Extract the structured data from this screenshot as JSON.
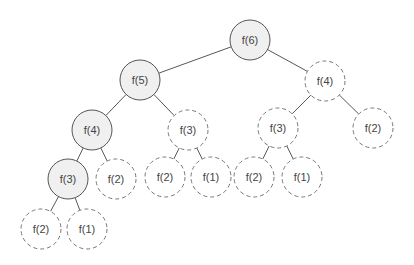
{
  "diagram": {
    "type": "recursion-tree",
    "radius": 20,
    "nodes": [
      {
        "id": "n0",
        "label": "f(6)",
        "x": 250,
        "y": 40,
        "style": "solid"
      },
      {
        "id": "n1",
        "label": "f(5)",
        "x": 140,
        "y": 80,
        "style": "solid"
      },
      {
        "id": "n2",
        "label": "f(4)",
        "x": 325,
        "y": 81,
        "style": "dashed"
      },
      {
        "id": "n3",
        "label": "f(4)",
        "x": 92,
        "y": 130,
        "style": "solid"
      },
      {
        "id": "n4",
        "label": "f(3)",
        "x": 188,
        "y": 130,
        "style": "dashed"
      },
      {
        "id": "n5",
        "label": "f(3)",
        "x": 278,
        "y": 128,
        "style": "dashed"
      },
      {
        "id": "n6",
        "label": "f(2)",
        "x": 373,
        "y": 128,
        "style": "dashed"
      },
      {
        "id": "n7",
        "label": "f(3)",
        "x": 68,
        "y": 179,
        "style": "solid"
      },
      {
        "id": "n8",
        "label": "f(2)",
        "x": 116,
        "y": 179,
        "style": "dashed"
      },
      {
        "id": "n9",
        "label": "f(2)",
        "x": 165,
        "y": 177,
        "style": "dashed"
      },
      {
        "id": "n10",
        "label": "f(1)",
        "x": 211,
        "y": 177,
        "style": "dashed"
      },
      {
        "id": "n11",
        "label": "f(2)",
        "x": 254,
        "y": 177,
        "style": "dashed"
      },
      {
        "id": "n12",
        "label": "f(1)",
        "x": 302,
        "y": 177,
        "style": "dashed"
      },
      {
        "id": "n13",
        "label": "f(2)",
        "x": 41,
        "y": 229,
        "style": "dashed"
      },
      {
        "id": "n14",
        "label": "f(1)",
        "x": 87,
        "y": 229,
        "style": "dashed"
      }
    ],
    "edges": [
      [
        "n0",
        "n1"
      ],
      [
        "n0",
        "n2"
      ],
      [
        "n1",
        "n3"
      ],
      [
        "n1",
        "n4"
      ],
      [
        "n2",
        "n5"
      ],
      [
        "n2",
        "n6"
      ],
      [
        "n3",
        "n7"
      ],
      [
        "n3",
        "n8"
      ],
      [
        "n4",
        "n9"
      ],
      [
        "n4",
        "n10"
      ],
      [
        "n5",
        "n11"
      ],
      [
        "n5",
        "n12"
      ],
      [
        "n7",
        "n13"
      ],
      [
        "n7",
        "n14"
      ]
    ]
  }
}
